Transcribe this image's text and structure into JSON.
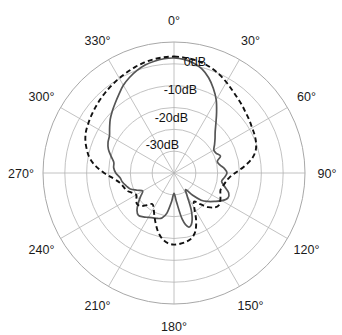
{
  "figure": {
    "kind": "polar-radiation-pattern",
    "background_color": "#ffffff",
    "center": {
      "x": 174,
      "y": 173
    },
    "outer_radius": 131
  },
  "axes": {
    "angle_labels": [
      {
        "text": "0°",
        "angle": 0
      },
      {
        "text": "30°",
        "angle": 30
      },
      {
        "text": "60°",
        "angle": 60
      },
      {
        "text": "90°",
        "angle": 90
      },
      {
        "text": "120°",
        "angle": 120
      },
      {
        "text": "150°",
        "angle": 150
      },
      {
        "text": "180°",
        "angle": 180
      },
      {
        "text": "210°",
        "angle": 210
      },
      {
        "text": "240°",
        "angle": 240
      },
      {
        "text": "270°",
        "angle": 270
      },
      {
        "text": "300°",
        "angle": 300
      },
      {
        "text": "330°",
        "angle": 330
      }
    ],
    "radial_labels": [
      {
        "text": "0dB",
        "value": 0
      },
      {
        "text": "-10dB",
        "value": -10
      },
      {
        "text": "-20dB",
        "value": -20
      },
      {
        "text": "-30dB",
        "value": -30
      }
    ],
    "grid_on": true,
    "ring_count": 6,
    "spoke_step_deg": 30,
    "grid_color": "#b3b3b3"
  },
  "chart_data": {
    "type": "line",
    "subtype": "polar",
    "title": "",
    "xlabel": "",
    "ylabel": "",
    "theta_unit": "degrees",
    "r_unit": "dB",
    "rlim": [
      -40,
      5
    ],
    "rticks": [
      0,
      -10,
      -20,
      -30
    ],
    "theta_zero_location": "N",
    "theta_direction": "clockwise",
    "series": [
      {
        "name": "measured",
        "style": "solid",
        "color": "#555555",
        "theta": [
          0,
          5,
          10,
          15,
          20,
          25,
          30,
          35,
          40,
          45,
          50,
          55,
          60,
          65,
          70,
          75,
          80,
          85,
          90,
          95,
          100,
          105,
          110,
          115,
          120,
          125,
          130,
          135,
          140,
          145,
          150,
          155,
          160,
          165,
          170,
          175,
          180,
          185,
          190,
          195,
          200,
          205,
          210,
          215,
          220,
          225,
          230,
          235,
          240,
          245,
          250,
          255,
          260,
          265,
          270,
          275,
          280,
          285,
          290,
          295,
          300,
          305,
          310,
          315,
          320,
          325,
          330,
          335,
          340,
          345,
          350,
          355
        ],
        "r": [
          -0.5,
          -0.8,
          -1.6,
          -3.0,
          -5.2,
          -8.0,
          -11.0,
          -14.5,
          -17.6,
          -20.0,
          -21.6,
          -23.0,
          -24.2,
          -24.0,
          -23.0,
          -24.6,
          -24.0,
          -22.6,
          -21.8,
          -22.6,
          -23.4,
          -22.0,
          -20.0,
          -19.6,
          -21.0,
          -23.0,
          -24.8,
          -26.8,
          -30.0,
          -33.0,
          -31.0,
          -26.0,
          -22.0,
          -20.8,
          -24.0,
          -30.0,
          -33.0,
          -30.0,
          -26.0,
          -24.0,
          -23.4,
          -23.0,
          -22.4,
          -21.6,
          -21.0,
          -22.0,
          -24.0,
          -26.0,
          -27.6,
          -26.0,
          -24.0,
          -23.0,
          -22.0,
          -21.4,
          -20.0,
          -19.2,
          -19.0,
          -17.6,
          -16.0,
          -15.0,
          -14.4,
          -13.0,
          -11.4,
          -10.0,
          -8.6,
          -7.0,
          -5.2,
          -3.8,
          -2.6,
          -1.6,
          -1.0,
          -0.6
        ]
      },
      {
        "name": "simulated",
        "style": "dashed",
        "color": "#111111",
        "theta": [
          0,
          5,
          10,
          15,
          20,
          25,
          30,
          35,
          40,
          45,
          50,
          55,
          60,
          65,
          70,
          75,
          80,
          85,
          90,
          95,
          100,
          105,
          110,
          115,
          120,
          125,
          130,
          135,
          140,
          145,
          150,
          155,
          160,
          165,
          170,
          175,
          180,
          185,
          190,
          195,
          200,
          205,
          210,
          215,
          220,
          225,
          230,
          235,
          240,
          245,
          250,
          255,
          260,
          265,
          270,
          275,
          280,
          285,
          290,
          295,
          300,
          305,
          310,
          315,
          320,
          325,
          330,
          335,
          340,
          345,
          350,
          355
        ],
        "r": [
          0.0,
          -0.2,
          -0.5,
          -1.0,
          -1.8,
          -2.8,
          -4.0,
          -5.2,
          -6.2,
          -7.0,
          -7.8,
          -8.4,
          -9.0,
          -9.4,
          -10.0,
          -11.0,
          -13.0,
          -16.0,
          -19.0,
          -21.0,
          -22.0,
          -22.6,
          -23.0,
          -22.4,
          -21.6,
          -21.0,
          -21.6,
          -23.4,
          -26.0,
          -28.0,
          -26.0,
          -22.0,
          -18.6,
          -16.8,
          -16.0,
          -15.6,
          -15.4,
          -15.8,
          -17.0,
          -19.0,
          -21.6,
          -24.0,
          -26.0,
          -27.0,
          -25.6,
          -24.0,
          -23.4,
          -24.2,
          -25.0,
          -24.0,
          -22.6,
          -22.0,
          -21.0,
          -19.0,
          -16.0,
          -13.0,
          -10.6,
          -9.0,
          -7.6,
          -6.6,
          -6.0,
          -5.4,
          -4.8,
          -4.2,
          -3.6,
          -3.0,
          -2.4,
          -1.8,
          -1.2,
          -0.7,
          -0.3,
          -0.1
        ]
      }
    ]
  }
}
